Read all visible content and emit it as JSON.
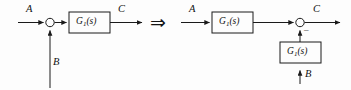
{
  "figure": {
    "type": "block-diagram",
    "topic": "block-diagram-equivalence-summing-junction-moved-past-block",
    "relation_symbol": "⇒",
    "background_color": "#fdfdfd",
    "line_color": "#1a1a1a"
  },
  "left_diagram": {
    "name": "original-form",
    "input_a_label": "A",
    "input_b_label": "B",
    "output_label": "C",
    "block": {
      "name": "G1",
      "base": "G",
      "subscript": "1",
      "argument": "(s)",
      "full_label": "G1(s)"
    },
    "summing_junction": {
      "name": "sum-left",
      "shape": "circle",
      "signs": []
    }
  },
  "right_diagram": {
    "name": "equivalent-form",
    "input_a_label": "A",
    "input_b_label": "B",
    "output_label": "C",
    "forward_block": {
      "name": "G1-forward",
      "base": "G",
      "subscript": "1",
      "argument": "(s)",
      "full_label": "G1(s)"
    },
    "branch_block": {
      "name": "G1-branch",
      "base": "G",
      "subscript": "1",
      "argument": "(s)",
      "full_label": "G1(s)"
    },
    "summing_junction": {
      "name": "sum-right",
      "shape": "circle",
      "sign_mark": "–"
    }
  }
}
